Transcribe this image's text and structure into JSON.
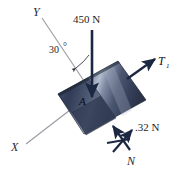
{
  "figure": {
    "background_color": "#ffffff",
    "plate": {
      "name": "inclined-rectangular-plate",
      "fill_dark": "#2b3550",
      "fill_mid": "#4a5670",
      "fill_light": "#9aa6bd",
      "edge_color": "#1d2436"
    },
    "axes": {
      "y_label": "Y",
      "x_label": "X",
      "axis_color": "#8d8d95"
    },
    "forces": [
      {
        "name": "applied-load",
        "label": "450 N",
        "direction": "down",
        "color": "#1c2742"
      },
      {
        "name": "tension",
        "label": "T",
        "subscript": "1",
        "direction": "up-right",
        "color": "#1c2742"
      },
      {
        "name": "friction-or-secondary",
        "label": ".32 N",
        "direction": "up-right",
        "color": "#1c2742"
      },
      {
        "name": "normal-force",
        "label": "N",
        "direction": "up-left",
        "color": "#1c2742"
      }
    ],
    "angle": {
      "label": "30",
      "unit": "°",
      "between": "Y-axis and 450 N load line"
    },
    "point": {
      "label": "A",
      "description": "application point on plate"
    }
  }
}
